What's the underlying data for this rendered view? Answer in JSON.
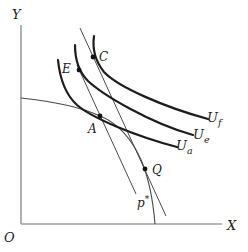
{
  "figure_type": "indifference-curve-trade-diagram",
  "colors": {
    "bg": "#ffffff",
    "axis": "#9c9c9c",
    "thin": "#4a4a4a",
    "curve": "#1c1c1c",
    "dot": "#111111",
    "text": "#1a1a1a"
  },
  "labels": {
    "y_axis": "Y",
    "x_axis": "X",
    "origin": "O",
    "point_e": "E",
    "point_c": "C",
    "point_a": "A",
    "point_q": "Q",
    "price_base": "p",
    "price_sup": "*",
    "curve_f_base": "U",
    "curve_f_sub": "f",
    "curve_e_base": "U",
    "curve_e_sub": "e",
    "curve_a_base": "U",
    "curve_a_sub": "a"
  }
}
